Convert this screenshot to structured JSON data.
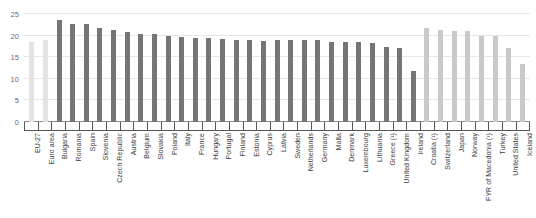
{
  "chart_data": {
    "type": "bar",
    "title": "",
    "subtitle": "",
    "xlabel": "",
    "ylabel": "",
    "ylim": [
      0,
      25
    ],
    "y_ticks": [
      0,
      5,
      10,
      15,
      20,
      25
    ],
    "grid": true,
    "legend": "none",
    "categories": [
      "EU-27",
      "Euro area",
      "Bulgaria",
      "Romania",
      "Spain",
      "Slovenia",
      "Czech Republic",
      "Austria",
      "Belgium",
      "Slovakia",
      "Poland",
      "Italy",
      "France",
      "Hungary",
      "Portugal",
      "Finland",
      "Estonia",
      "Cyprus",
      "Latvia",
      "Sweden",
      "Netherlands",
      "Germany",
      "Malta",
      "Denmark",
      "Luxembourg",
      "Lithuania",
      "Greece (¹)",
      "United Kingdom",
      "Ireland",
      "Croatia (¹)",
      "Switzerland",
      "Japan",
      "Norway",
      "FYR of Macedonia (¹)",
      "Turkey",
      "United States",
      "Iceland"
    ],
    "values": [
      18.6,
      19.1,
      23.6,
      22.8,
      22.6,
      21.7,
      21.3,
      20.8,
      20.3,
      20.3,
      19.8,
      19.7,
      19.5,
      19.5,
      19.2,
      19.1,
      19.0,
      18.8,
      19.0,
      19.0,
      18.9,
      18.9,
      18.6,
      18.5,
      18.5,
      18.4,
      17.3,
      17.2,
      11.9,
      21.8,
      21.3,
      21.1,
      21.0,
      19.8,
      19.8,
      17.2,
      13.5
    ],
    "groups": [
      "aggregate",
      "aggregate",
      "eu",
      "eu",
      "eu",
      "eu",
      "eu",
      "eu",
      "eu",
      "eu",
      "eu",
      "eu",
      "eu",
      "eu",
      "eu",
      "eu",
      "eu",
      "eu",
      "eu",
      "eu",
      "eu",
      "eu",
      "eu",
      "eu",
      "eu",
      "eu",
      "eu",
      "eu",
      "eu",
      "noneu",
      "noneu",
      "noneu",
      "noneu",
      "noneu",
      "noneu",
      "noneu",
      "noneu"
    ],
    "colors": {
      "aggregate": "#e3e3e3",
      "eu": "#757575",
      "noneu": "#c9c9c9",
      "gridline": "#e6e6e6",
      "axis": "#555555",
      "tick_label": "#6b6b6b",
      "category_label": "#3b3b3b"
    }
  }
}
